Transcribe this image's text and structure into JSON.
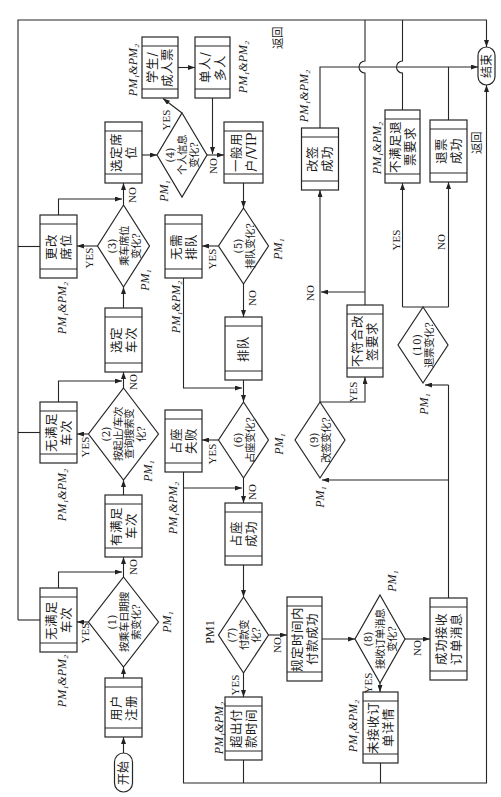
{
  "diagram": {
    "terminals": {
      "start": "开始",
      "end": "结束"
    },
    "return_labels": [
      "返回",
      "返回"
    ],
    "processes": {
      "user_register": {
        "lines": [
          "用户",
          "注册"
        ]
      },
      "no_train_by_date": {
        "lines": [
          "无满足",
          "车次"
        ],
        "pm": "PM₁&PM₂"
      },
      "train_available": {
        "lines": [
          "有满足",
          "车次"
        ]
      },
      "no_train_by_route": {
        "lines": [
          "无满足",
          "车次"
        ],
        "pm": "PM₁&PM₂"
      },
      "select_train": {
        "lines": [
          "选定",
          "车次"
        ]
      },
      "change_seat": {
        "lines": [
          "更改",
          "席位"
        ],
        "pm": "PM₁&PM₂"
      },
      "select_seat": {
        "lines": [
          "选定席",
          "位"
        ]
      },
      "student_adult_ticket": {
        "lines": [
          "学生/",
          "成人票"
        ],
        "pm": "PM₁&PM₂"
      },
      "single_multi_passenger": {
        "lines": [
          "单人/",
          "多人"
        ],
        "pm": "PM₁&PM₂"
      },
      "regular_vip_user": {
        "lines": [
          "一般用",
          "户/VIP"
        ]
      },
      "no_queue": {
        "lines": [
          "无需",
          "排队"
        ],
        "pm": "PM₁&PM₂"
      },
      "queue": {
        "lines": [
          "排队"
        ]
      },
      "seat_hold_failed": {
        "lines": [
          "占座",
          "失败"
        ],
        "pm": "PM₁&PM₂"
      },
      "seat_hold_success": {
        "lines": [
          "占座",
          "成功"
        ]
      },
      "payment_timeout": {
        "lines": [
          "超出付",
          "款时间"
        ],
        "pm": "PM₁&PM₂"
      },
      "payment_success": {
        "lines": [
          "规定时间内",
          "付款成功"
        ]
      },
      "order_detail_not_received": {
        "lines": [
          "未接收订",
          "单详情"
        ],
        "pm": "PM₁&PM₂"
      },
      "order_message_received": {
        "lines": [
          "成功接收",
          "订单消息"
        ]
      },
      "change_success": {
        "lines": [
          "改签",
          "成功"
        ],
        "pm": "PM₁&PM₂"
      },
      "change_rejected": {
        "lines": [
          "不符合改",
          "签要求"
        ]
      },
      "refund_rejected": {
        "lines": [
          "不满足退",
          "票要求"
        ],
        "pm": "PM₁&PM₂"
      },
      "refund_success": {
        "lines": [
          "退票",
          "成功"
        ]
      }
    },
    "decisions": {
      "d1": {
        "lines": [
          "(1)",
          "按乘车日期搜",
          "索变化?"
        ],
        "pm": "PM₁",
        "yes": "YES",
        "no": "NO"
      },
      "d2": {
        "lines": [
          "(2)",
          "按起止/车次",
          "查询搜索变",
          "化?"
        ],
        "pm": "PM₁",
        "yes": "YES",
        "no": "NO"
      },
      "d3": {
        "lines": [
          "(3)",
          "乘车席位",
          "变化?"
        ],
        "pm": "PM₁",
        "yes": "YES",
        "no": "NO"
      },
      "d4": {
        "lines": [
          "(4)",
          "个人信息",
          "变化?"
        ],
        "pm": "PM₁",
        "yes": "YES",
        "no": "NO"
      },
      "d5": {
        "lines": [
          "(5)",
          "排队变化?"
        ],
        "pm": "PM₁",
        "yes": "YES",
        "no": "NO"
      },
      "d6": {
        "lines": [
          "(6)",
          "占座变化?"
        ],
        "pm": "PM₁",
        "yes": "YES",
        "no": "NO"
      },
      "d7": {
        "lines": [
          "(7)",
          "付款变",
          "化?"
        ],
        "pm": "PM1",
        "yes": "YES",
        "no": "NO"
      },
      "d8": {
        "lines": [
          "(8)",
          "接收订单消息",
          "变化?"
        ],
        "pm": "PM₁",
        "yes": "YES",
        "no": "NO"
      },
      "d9": {
        "lines": [
          "(9)",
          "改签变化?"
        ],
        "pm": "PM₁",
        "yes": "YES",
        "no": "NO"
      },
      "d10": {
        "lines": [
          "(10)",
          "退票变化?"
        ],
        "pm": "PM₁",
        "yes": "YES",
        "no": "NO"
      }
    },
    "colors": {
      "line": "#262626",
      "background": "#ffffff",
      "text": "#1b1b1b"
    }
  }
}
